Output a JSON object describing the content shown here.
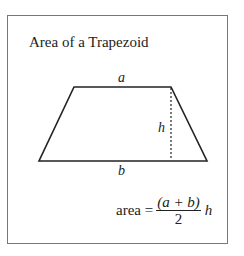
{
  "title": "Area of a Trapezoid",
  "labels": {
    "top_base": "a",
    "height": "h",
    "bottom_base": "b"
  },
  "formula": {
    "lhs": "area =",
    "numerator": "(a + b)",
    "denominator": "2",
    "multiplier": "h"
  },
  "colors": {
    "stroke": "#222222",
    "frame": "#777777"
  }
}
